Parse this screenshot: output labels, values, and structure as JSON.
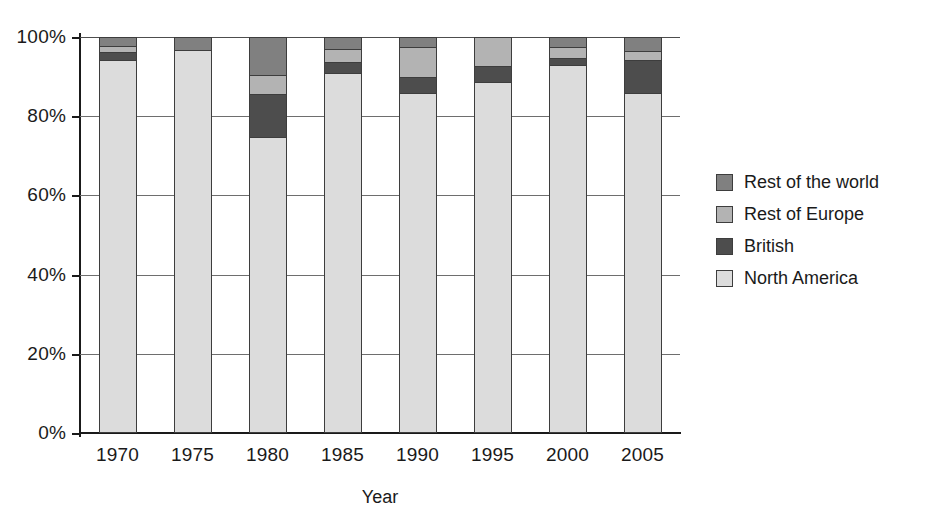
{
  "chart_data": {
    "type": "bar",
    "subtype": "stacked-percent",
    "title": "",
    "xlabel": "Year",
    "ylabel": "",
    "categories": [
      "1970",
      "1975",
      "1980",
      "1985",
      "1990",
      "1995",
      "2000",
      "2005"
    ],
    "ylim": [
      0,
      100
    ],
    "y_ticks": [
      "0%",
      "20%",
      "40%",
      "60%",
      "80%",
      "100%"
    ],
    "y_tick_values": [
      0,
      20,
      40,
      60,
      80,
      100
    ],
    "grid": true,
    "legend_position": "right",
    "series": [
      {
        "name": "North America",
        "color": "#dcdcdc",
        "values": [
          94.2,
          96.7,
          74.7,
          90.9,
          85.9,
          88.6,
          93.0,
          85.9
        ]
      },
      {
        "name": "British",
        "color": "#4d4d4d",
        "values": [
          2.0,
          0.0,
          11.0,
          2.9,
          4.0,
          4.2,
          1.7,
          8.4
        ]
      },
      {
        "name": "Rest of Europe",
        "color": "#b3b3b3",
        "values": [
          1.6,
          0.0,
          4.8,
          3.1,
          7.6,
          7.2,
          2.9,
          2.1
        ]
      },
      {
        "name": "Rest of the world",
        "color": "#808080",
        "values": [
          2.2,
          3.3,
          9.5,
          3.1,
          2.5,
          0.0,
          2.4,
          3.6
        ]
      }
    ]
  },
  "legend": {
    "items": [
      {
        "label": "Rest of the world",
        "color": "#808080"
      },
      {
        "label": "Rest of Europe",
        "color": "#b3b3b3"
      },
      {
        "label": "British",
        "color": "#4d4d4d"
      },
      {
        "label": "North America",
        "color": "#dcdcdc"
      }
    ]
  },
  "axis": {
    "x_title": "Year"
  },
  "colors": {
    "axis": "#1a1a1a",
    "grid": "#6e6e6e",
    "bar_outline": "#3d3d3d",
    "background": "#ffffff"
  }
}
